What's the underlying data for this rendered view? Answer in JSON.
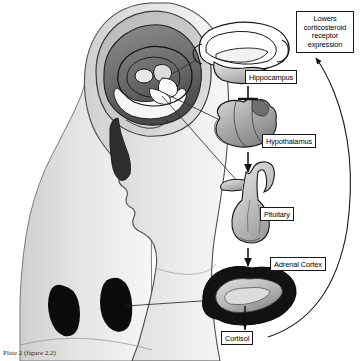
{
  "figure": {
    "caption": "Plate 2 (figure 2.2)"
  },
  "labels": {
    "hippocampus": "Hippocampus",
    "hypothalamus": "Hypothalamus",
    "pituitary": "Pituitary",
    "adrenal_cortex": "Adrenal Cortex",
    "cortisol": "Cortisol"
  },
  "callouts": {
    "feedback": "Lowers\ncorticosteroid\nreceptor\nexpression"
  },
  "anatomy": {
    "head_figure": "human head and torso sagittal cutaway",
    "brain": "brain with hippocampus highlighted",
    "kidneys": "pair of kidneys",
    "hippocampus_shape": "hippocampus structure",
    "hypothalamus_shape": "hypothalamus structure",
    "pituitary_shape": "pituitary gland structure",
    "adrenal_cortex_shape": "adrenal cortex cross section"
  },
  "connectors": {
    "hippocampus_to_hypothalamus": "inhibitory T-bar connector",
    "hypothalamus_to_pituitary": "downward arrow",
    "pituitary_to_adrenal": "downward arrow",
    "adrenal_to_cortisol": "downward arrow",
    "cortisol_feedback": "curved feedback arrow to callout"
  },
  "colors": {
    "line": "#1a1a1a",
    "tissue_light": "#d8d8d8",
    "tissue_mid": "#9a9a9a",
    "tissue_dark": "#3a3a3a",
    "background": "#ffffff"
  }
}
